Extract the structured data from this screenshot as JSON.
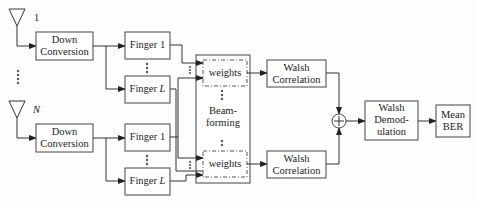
{
  "antennas": [
    {
      "label": "1"
    },
    {
      "label": "N"
    }
  ],
  "branches": [
    {
      "down_conversion": {
        "line1": "Down",
        "line2": "Conversion"
      },
      "finger_first": {
        "text": "Finger ",
        "index": "1"
      },
      "finger_last": {
        "text": "Finger ",
        "index": "L"
      }
    },
    {
      "down_conversion": {
        "line1": "Down",
        "line2": "Conversion"
      },
      "finger_first": {
        "text": "Finger ",
        "index": "1"
      },
      "finger_last": {
        "text": "Finger ",
        "index": "L"
      }
    }
  ],
  "beamforming": {
    "line1": "Beam-",
    "line2": "forming",
    "weights_top": "weights",
    "weights_bottom": "weights"
  },
  "walsh_correlation": [
    {
      "line1": "Walsh",
      "line2": "Correlation"
    },
    {
      "line1": "Walsh",
      "line2": "Correlation"
    }
  ],
  "summer": {
    "symbol": "+"
  },
  "walsh_demodulation": {
    "line1": "Walsh",
    "line2": "Demod-",
    "line3": "ulation"
  },
  "mean_ber": {
    "line1": "Mean",
    "line2": "BER"
  }
}
